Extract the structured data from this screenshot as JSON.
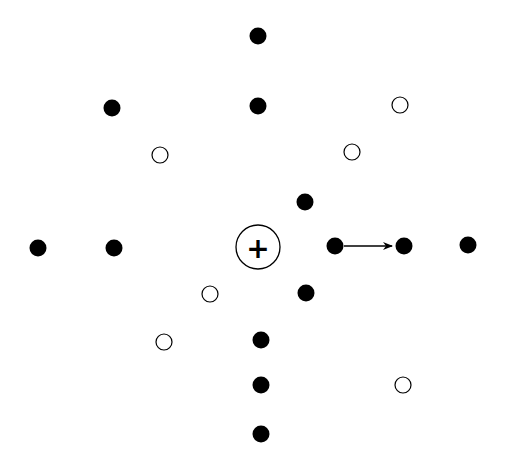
{
  "diagram": {
    "width": 505,
    "height": 460,
    "center_ion": {
      "x": 258,
      "y": 247,
      "r": 22,
      "symbol": "+"
    },
    "filled_dots": [
      {
        "x": 258,
        "y": 36
      },
      {
        "x": 258,
        "y": 106
      },
      {
        "x": 112,
        "y": 108
      },
      {
        "x": 305,
        "y": 202
      },
      {
        "x": 38,
        "y": 248
      },
      {
        "x": 114,
        "y": 248
      },
      {
        "x": 335,
        "y": 246
      },
      {
        "x": 404,
        "y": 246
      },
      {
        "x": 468,
        "y": 245
      },
      {
        "x": 306,
        "y": 293
      },
      {
        "x": 261,
        "y": 340
      },
      {
        "x": 261,
        "y": 385
      },
      {
        "x": 261,
        "y": 434
      }
    ],
    "open_dots": [
      {
        "x": 400,
        "y": 105
      },
      {
        "x": 160,
        "y": 155
      },
      {
        "x": 352,
        "y": 152
      },
      {
        "x": 210,
        "y": 294
      },
      {
        "x": 164,
        "y": 342
      },
      {
        "x": 403,
        "y": 385
      }
    ],
    "arrow": {
      "x1": 344,
      "y1": 246,
      "x2": 392,
      "y2": 246
    },
    "colors": {
      "ink": "#000000",
      "background": "#ffffff"
    }
  }
}
